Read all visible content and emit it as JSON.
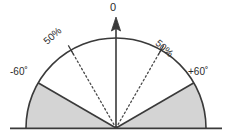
{
  "diagram": {
    "background_color": "#ffffff",
    "stroke_color": "#3a3a3a",
    "shade_color": "#d4d4d4",
    "labels": {
      "boresight": "0",
      "angle_left": "-60˚",
      "angle_right": "+60˚",
      "percent_left": "50%",
      "percent_right": "50%"
    },
    "geometry": {
      "center_x": 116,
      "center_y": 128,
      "radius": 90,
      "baseline_y": 128,
      "baseline_x_start": 10,
      "baseline_x_end": 222,
      "arrow_tip_y": 20,
      "shaded_sector_angles_deg": [
        60,
        90
      ],
      "dotted_ray_angles_deg": [
        30
      ],
      "arc_span_deg": 180
    }
  }
}
